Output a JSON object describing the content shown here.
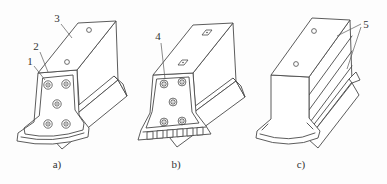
{
  "diagram": {
    "background": "#fdfdfd",
    "line_color": "#4a4a4a",
    "label_color": "#333333",
    "panels": [
      {
        "caption": "a)",
        "callouts": [
          "1",
          "2",
          "3"
        ]
      },
      {
        "caption": "b)",
        "callouts": [
          "4"
        ]
      },
      {
        "caption": "c)",
        "callouts": [
          "5"
        ]
      }
    ]
  }
}
